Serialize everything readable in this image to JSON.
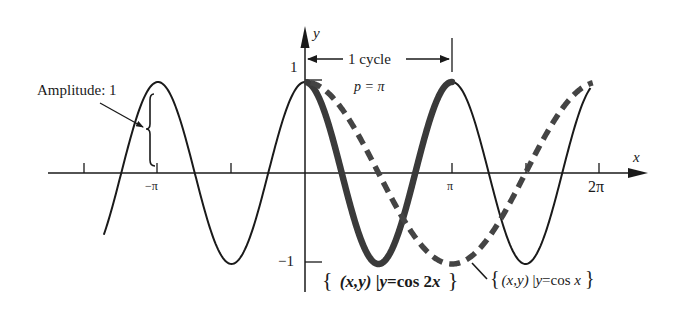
{
  "figure": {
    "type": "function-graph"
  },
  "axes": {
    "x_label": "x",
    "y_label": "y",
    "x_ticks": [
      {
        "value": "-3pi/2",
        "label": ""
      },
      {
        "value": "-pi",
        "label": "−π"
      },
      {
        "value": "-pi/2",
        "label": ""
      },
      {
        "value": "pi",
        "label": "π"
      },
      {
        "value": "3pi/2",
        "label": ""
      },
      {
        "value": "2pi",
        "label": "2π"
      }
    ],
    "y_ticks": [
      {
        "value": 1,
        "label": "1"
      },
      {
        "value": -1,
        "label": "−1"
      }
    ]
  },
  "annotations": {
    "amplitude": "Amplitude: 1",
    "cycle": "1 cycle",
    "period": "p = π",
    "cos2x_label": "{ (x,y) | y = cos 2x }",
    "cosx_label": "{ (x,y) | y = cos x }"
  },
  "chart_data": {
    "type": "line",
    "title": "",
    "xlabel": "x",
    "ylabel": "y",
    "xlim": [
      -5.0,
      6.6
    ],
    "ylim": [
      -1,
      1
    ],
    "grid": false,
    "series": [
      {
        "name": "y = cos 2x",
        "style": "solid (thick over [0, π])",
        "domain": [
          -4.3,
          6.1
        ],
        "formula": "cos(2x)"
      },
      {
        "name": "y = cos x",
        "style": "dashed, thick",
        "domain": [
          0,
          6.1
        ],
        "formula": "cos(x)"
      }
    ],
    "period_cos2x": "π",
    "amplitude": 1
  },
  "colors": {
    "ink": "#1a1a1a",
    "thick_curve": "#3a3a3a",
    "background": "#ffffff"
  }
}
